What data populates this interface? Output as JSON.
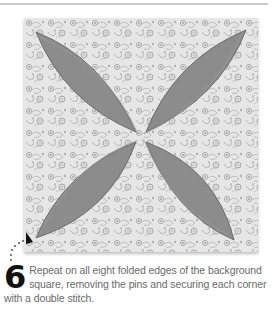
{
  "illustration": {
    "description": "Cathedral window quilt block: floral print square with four grey petal-shaped inserts meeting at center",
    "colors": {
      "fabric_background": "#e4e4e4",
      "fabric_pattern": "#a9a9a9",
      "petal_fill": "#8c8c8c",
      "petal_edge": "#6e6e6e",
      "top_rule": "#c8c8c8"
    },
    "pointer_icon": "dotted-arrow-icon"
  },
  "step": {
    "number": "6",
    "text": "Repeat on all eight folded edges of the background square, removing the pins and securing each corner with a double stitch."
  }
}
